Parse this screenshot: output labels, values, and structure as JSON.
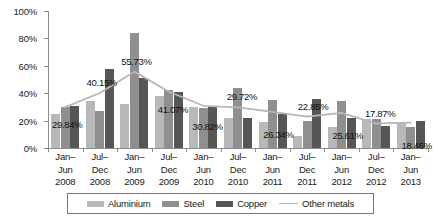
{
  "chart_data": {
    "type": "bar",
    "title": "",
    "subtitle": "",
    "xlabel": "",
    "ylabel": "",
    "ylim": [
      0,
      100
    ],
    "y_tick_labels": [
      "0%",
      "20%",
      "40%",
      "60%",
      "80%",
      "100%"
    ],
    "y_ticks": [
      0,
      20,
      40,
      60,
      80,
      100
    ],
    "grid": false,
    "legend_position": "bottom",
    "categories": [
      "Jan–\nJun\n2008",
      "Jul–\nDec\n2008",
      "Jan–\nJun\n2009",
      "Jul–\nDec\n2009",
      "Jan–\nJun\n2010",
      "Jul–\nDec\n2010",
      "Jan–\nJun\n2011",
      "Jul–\nDec\n2011",
      "Jan–\nJun\n2012",
      "Jul–\nDec\n2012",
      "Jan–\nJun\n2013"
    ],
    "category_lines": [
      [
        "Jan–",
        "Jun",
        "2008"
      ],
      [
        "Jul–",
        "Dec",
        "2008"
      ],
      [
        "Jan–",
        "Jun",
        "2009"
      ],
      [
        "Jul–",
        "Dec",
        "2009"
      ],
      [
        "Jan–",
        "Jun",
        "2010"
      ],
      [
        "Jul–",
        "Dec",
        "2010"
      ],
      [
        "Jan–",
        "Jun",
        "2011"
      ],
      [
        "Jul–",
        "Dec",
        "2011"
      ],
      [
        "Jan–",
        "Jun",
        "2012"
      ],
      [
        "Jul–",
        "Dec",
        "2012"
      ],
      [
        "Jan–",
        "Jun",
        "2013"
      ]
    ],
    "series": [
      {
        "name": "Aluminium",
        "type": "bar",
        "color": "#b8b8b8",
        "values": [
          25,
          34,
          32,
          38,
          30,
          22,
          19,
          9,
          15,
          21,
          18
        ]
      },
      {
        "name": "Steel",
        "type": "bar",
        "color": "#8f8f8f",
        "values": [
          30,
          27,
          84,
          42,
          29,
          44,
          35,
          20,
          34,
          21,
          15
        ]
      },
      {
        "name": "Copper",
        "type": "bar",
        "color": "#565656",
        "values": [
          31,
          58,
          51,
          41,
          30,
          22,
          25,
          36,
          22,
          16,
          20
        ]
      },
      {
        "name": "Other metals",
        "type": "line",
        "color": "#b6b6b6",
        "values": [
          29.84,
          40.15,
          55.73,
          41.07,
          30.82,
          29.72,
          26.34,
          22.85,
          25.61,
          17.87,
          18.46
        ]
      }
    ],
    "data_labels": [
      "29.84%",
      "40.15%",
      "55.73%",
      "41.07%",
      "30.82%",
      "29.72%",
      "26.34%",
      "22.85%",
      "25.61%",
      "17.87%",
      "18.46%"
    ],
    "data_label_offsets": [
      {
        "dx": 2,
        "dy": 17
      },
      {
        "dx": 2,
        "dy": -11
      },
      {
        "dx": 2,
        "dy": -11
      },
      {
        "dx": 4,
        "dy": 17
      },
      {
        "dx": 4,
        "dy": 20
      },
      {
        "dx": 4,
        "dy": -11
      },
      {
        "dx": 6,
        "dy": 22
      },
      {
        "dx": 6,
        "dy": -11
      },
      {
        "dx": 6,
        "dy": 22
      },
      {
        "dx": 4,
        "dy": -11
      },
      {
        "dx": 6,
        "dy": 22
      }
    ]
  },
  "legend": {
    "items": [
      {
        "label": "Aluminium",
        "swatch": "aluminium"
      },
      {
        "label": "Steel",
        "swatch": "steel"
      },
      {
        "label": "Copper",
        "swatch": "copper"
      },
      {
        "label": "Other metals",
        "swatch": "line"
      }
    ]
  }
}
